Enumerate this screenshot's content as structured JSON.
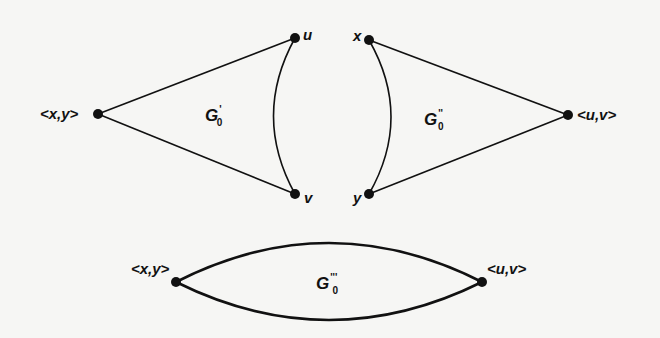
{
  "diagram": {
    "type": "graph-construction",
    "colors": {
      "ink": "#111111",
      "background": "#f6f6f4"
    },
    "graphs": [
      {
        "id": "G0_prime",
        "label": {
          "base": "G",
          "superscript": "'",
          "subscript": "0"
        },
        "nodes": [
          {
            "id": "xy_left",
            "label": "<x,y>"
          },
          {
            "id": "u",
            "label": "u"
          },
          {
            "id": "v",
            "label": "v"
          }
        ],
        "edges": [
          {
            "from": "xy_left",
            "to": "u",
            "style": "straight"
          },
          {
            "from": "xy_left",
            "to": "v",
            "style": "straight"
          },
          {
            "from": "u",
            "to": "v",
            "style": "curved"
          }
        ]
      },
      {
        "id": "G0_doubleprime",
        "label": {
          "base": "G",
          "superscript": "''",
          "subscript": "0"
        },
        "nodes": [
          {
            "id": "x",
            "label": "x"
          },
          {
            "id": "y",
            "label": "y"
          },
          {
            "id": "uv_right",
            "label": "<u,v>"
          }
        ],
        "edges": [
          {
            "from": "x",
            "to": "uv_right",
            "style": "straight"
          },
          {
            "from": "y",
            "to": "uv_right",
            "style": "straight"
          },
          {
            "from": "x",
            "to": "y",
            "style": "curved"
          }
        ]
      },
      {
        "id": "G0_tripleprime",
        "label": {
          "base": "G",
          "superscript": "'''",
          "subscript": "0"
        },
        "nodes": [
          {
            "id": "xy_bottom",
            "label": "<x,y>"
          },
          {
            "id": "uv_bottom",
            "label": "<u,v>"
          }
        ],
        "edges": [
          {
            "from": "xy_bottom",
            "to": "uv_bottom",
            "style": "curved-upper"
          },
          {
            "from": "xy_bottom",
            "to": "uv_bottom",
            "style": "curved-lower"
          }
        ]
      }
    ]
  },
  "labels": {
    "xy_left": "<x,y>",
    "u": "u",
    "v": "v",
    "x": "x",
    "y": "y",
    "uv_right": "<u,v>",
    "xy_bottom": "<x,y>",
    "uv_bottom": "<u,v>",
    "g1": {
      "base": "G",
      "sup": "'",
      "sub": "0"
    },
    "g2": {
      "base": "G",
      "sup": "''",
      "sub": "0"
    },
    "g3": {
      "base": "G",
      "sup": "'''",
      "sub": "0"
    }
  }
}
